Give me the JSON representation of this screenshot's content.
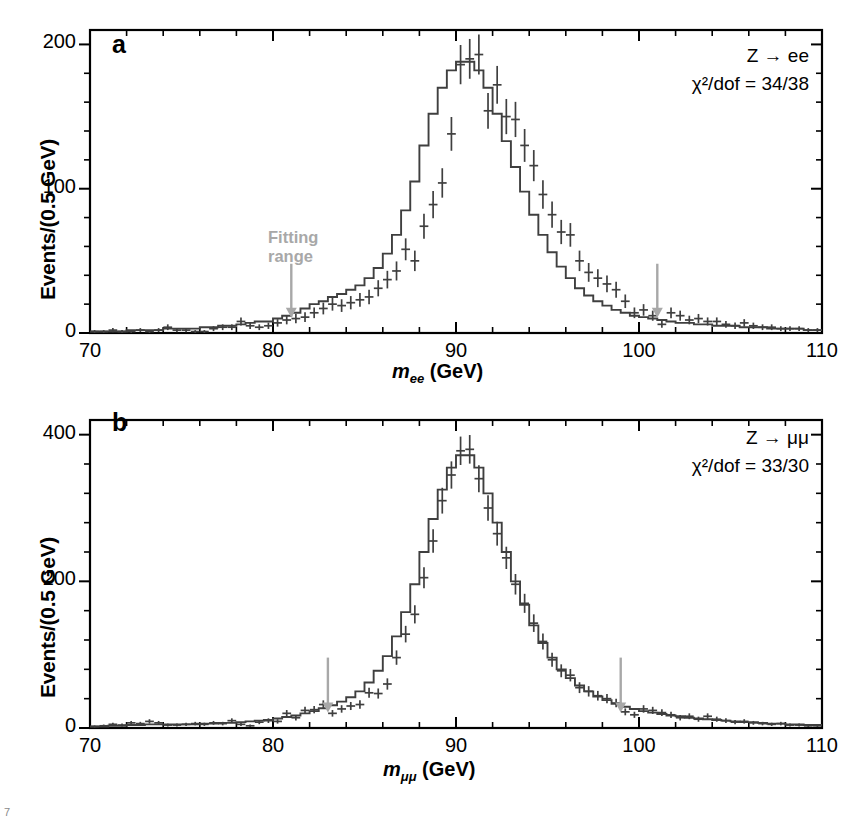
{
  "figure": {
    "width": 861,
    "height": 825,
    "background": "#ffffff",
    "ink_color": "#3f3f3f",
    "axis_color": "#000000",
    "fitting_range_color": "#a8a8a8",
    "corner_mark": "7"
  },
  "chart_data": [
    {
      "type": "line",
      "panel_letter": "a",
      "title": "",
      "xlabel": "m_ee (GeV)",
      "xlabel_parts": {
        "m": "m",
        "sub": "ee",
        "unit": "(GeV)"
      },
      "ylabel": "Events/(0.5 GeV)",
      "xlim": [
        70,
        110
      ],
      "ylim": [
        0,
        210
      ],
      "xticks": [
        70,
        80,
        90,
        100,
        110
      ],
      "xticks_labels": [
        "70",
        "80",
        "90",
        "100",
        "110"
      ],
      "yticks": [
        0,
        100,
        200
      ],
      "yticks_labels": [
        "0",
        "100",
        "200"
      ],
      "x_minor_step": 2,
      "y_minor_step": 20,
      "grid": false,
      "bin_width": 0.5,
      "annotations": [
        {
          "text": "Z → ee",
          "position": "top-right"
        },
        {
          "text": "χ²/dof = 34/38",
          "position": "top-right"
        }
      ],
      "arrows": [
        {
          "label": "Fitting range",
          "x": 81.0,
          "y_top": 48,
          "y_bottom": 12
        },
        {
          "label": "",
          "x": 101.0,
          "y_top": 48,
          "y_bottom": 12
        }
      ],
      "fitting_range_label": "Fitting\nrange",
      "fitting_range_text_line1": "Fitting",
      "fitting_range_text_line2": "range",
      "x": [
        70.25,
        70.75,
        71.25,
        71.75,
        72.25,
        72.75,
        73.25,
        73.75,
        74.25,
        74.75,
        75.25,
        75.75,
        76.25,
        76.75,
        77.25,
        77.75,
        78.25,
        78.75,
        79.25,
        79.75,
        80.25,
        80.75,
        81.25,
        81.75,
        82.25,
        82.75,
        83.25,
        83.75,
        84.25,
        84.75,
        85.25,
        85.75,
        86.25,
        86.75,
        87.25,
        87.75,
        88.25,
        88.75,
        89.25,
        89.75,
        90.25,
        90.75,
        91.25,
        91.75,
        92.25,
        92.75,
        93.25,
        93.75,
        94.25,
        94.75,
        95.25,
        95.75,
        96.25,
        96.75,
        97.25,
        97.75,
        98.25,
        98.75,
        99.25,
        99.75,
        100.25,
        100.75,
        101.25,
        101.75,
        102.25,
        102.75,
        103.25,
        103.75,
        104.25,
        104.75,
        105.25,
        105.75,
        106.25,
        106.75,
        107.25,
        107.75,
        108.25,
        108.75,
        109.25,
        109.75
      ],
      "curve_fit": [
        1,
        1,
        1,
        1,
        2,
        2,
        2,
        2,
        3,
        3,
        3,
        3,
        4,
        4,
        5,
        5,
        6,
        7,
        8,
        8,
        10,
        12,
        14,
        17,
        20,
        22,
        25,
        27,
        30,
        33,
        38,
        45,
        55,
        68,
        85,
        105,
        130,
        152,
        170,
        182,
        188,
        188,
        182,
        170,
        152,
        133,
        115,
        98,
        82,
        68,
        56,
        46,
        38,
        31,
        26,
        22,
        19,
        16,
        14,
        12,
        11,
        10,
        9,
        8,
        7,
        7,
        6,
        6,
        5,
        5,
        5,
        4,
        4,
        4,
        3,
        3,
        3,
        3,
        2,
        2
      ],
      "data_points": [
        1,
        1,
        2,
        1,
        1,
        2,
        1,
        2,
        4,
        2,
        2,
        1,
        1,
        3,
        4,
        4,
        8,
        5,
        4,
        5,
        7,
        9,
        10,
        11,
        14,
        17,
        20,
        19,
        21,
        23,
        25,
        31,
        37,
        43,
        58,
        50,
        74,
        89,
        104,
        138,
        186,
        190,
        193,
        154,
        172,
        150,
        148,
        130,
        116,
        96,
        82,
        70,
        68,
        50,
        42,
        38,
        34,
        30,
        22,
        14,
        16,
        12,
        6,
        14,
        12,
        9,
        10,
        8,
        8,
        6,
        5,
        7,
        5,
        4,
        4,
        3,
        3,
        3,
        2,
        2
      ],
      "errors": [
        1,
        1,
        1.4,
        1,
        1,
        1.4,
        1,
        1.4,
        2,
        1.4,
        1.4,
        1,
        1,
        1.7,
        2,
        2,
        2.8,
        2.2,
        2,
        2.2,
        2.6,
        3,
        3.2,
        3.3,
        3.7,
        4.1,
        4.5,
        4.4,
        4.6,
        4.8,
        5,
        5.6,
        6.1,
        6.6,
        7.6,
        7.1,
        8.6,
        9.4,
        10.2,
        11.7,
        13.6,
        13.8,
        13.9,
        12.4,
        13.1,
        12.2,
        12.2,
        11.4,
        10.8,
        9.8,
        9.1,
        8.4,
        8.2,
        7.1,
        6.5,
        6.2,
        5.8,
        5.5,
        4.7,
        3.7,
        4,
        3.5,
        2.4,
        3.7,
        3.5,
        3,
        3.2,
        2.8,
        2.8,
        2.4,
        2.2,
        2.6,
        2.2,
        2,
        2,
        1.7,
        1.7,
        1.7,
        1.4,
        1.4
      ]
    },
    {
      "type": "line",
      "panel_letter": "b",
      "title": "",
      "xlabel": "m_μμ (GeV)",
      "xlabel_parts": {
        "m": "m",
        "sub": "μμ",
        "unit": "(GeV)"
      },
      "ylabel": "Events/(0.5 GeV)",
      "xlim": [
        70,
        110
      ],
      "ylim": [
        0,
        420
      ],
      "xticks": [
        70,
        80,
        90,
        100,
        110
      ],
      "xticks_labels": [
        "70",
        "80",
        "90",
        "100",
        "110"
      ],
      "yticks": [
        0,
        200,
        400
      ],
      "yticks_labels": [
        "0",
        "200",
        "400"
      ],
      "x_minor_step": 2,
      "y_minor_step": 40,
      "grid": false,
      "bin_width": 0.5,
      "annotations": [
        {
          "text": "Z → μμ",
          "position": "top-right"
        },
        {
          "text": "χ²/dof = 33/30",
          "position": "top-right"
        }
      ],
      "arrows": [
        {
          "label": "Fitting range",
          "x": 83.0,
          "y_top": 96,
          "y_bottom": 24
        },
        {
          "label": "",
          "x": 99.0,
          "y_top": 96,
          "y_bottom": 24
        }
      ],
      "fitting_range_label": "Fitting\nrange",
      "fitting_range_text_line1": "Fitting",
      "fitting_range_text_line2": "range",
      "x": [
        70.25,
        70.75,
        71.25,
        71.75,
        72.25,
        72.75,
        73.25,
        73.75,
        74.25,
        74.75,
        75.25,
        75.75,
        76.25,
        76.75,
        77.25,
        77.75,
        78.25,
        78.75,
        79.25,
        79.75,
        80.25,
        80.75,
        81.25,
        81.75,
        82.25,
        82.75,
        83.25,
        83.75,
        84.25,
        84.75,
        85.25,
        85.75,
        86.25,
        86.75,
        87.25,
        87.75,
        88.25,
        88.75,
        89.25,
        89.75,
        90.25,
        90.75,
        91.25,
        91.75,
        92.25,
        92.75,
        93.25,
        93.75,
        94.25,
        94.75,
        95.25,
        95.75,
        96.25,
        96.75,
        97.25,
        97.75,
        98.25,
        98.75,
        99.25,
        99.75,
        100.25,
        100.75,
        101.25,
        101.75,
        102.25,
        102.75,
        103.25,
        103.75,
        104.25,
        104.75,
        105.25,
        105.75,
        106.25,
        106.75,
        107.25,
        107.75,
        108.25,
        108.75,
        109.25,
        109.75
      ],
      "curve_fit": [
        2,
        2,
        3,
        3,
        4,
        4,
        5,
        5,
        5,
        5,
        5,
        5,
        6,
        6,
        7,
        7,
        8,
        9,
        10,
        11,
        13,
        15,
        17,
        20,
        23,
        27,
        31,
        36,
        42,
        50,
        62,
        78,
        98,
        125,
        158,
        196,
        240,
        285,
        325,
        355,
        372,
        372,
        355,
        320,
        280,
        240,
        200,
        168,
        140,
        116,
        96,
        80,
        68,
        58,
        50,
        43,
        38,
        33,
        29,
        26,
        23,
        21,
        19,
        17,
        16,
        14,
        13,
        12,
        11,
        10,
        9,
        8,
        8,
        7,
        6,
        6,
        5,
        5,
        4,
        4
      ],
      "data_points": [
        2,
        3,
        5,
        4,
        7,
        6,
        9,
        7,
        4,
        4,
        5,
        6,
        5,
        7,
        6,
        10,
        5,
        3,
        8,
        10,
        9,
        20,
        14,
        24,
        25,
        32,
        20,
        26,
        30,
        32,
        48,
        47,
        60,
        96,
        128,
        155,
        205,
        255,
        310,
        345,
        378,
        380,
        340,
        300,
        265,
        232,
        196,
        170,
        143,
        118,
        93,
        78,
        72,
        55,
        50,
        44,
        40,
        34,
        22,
        18,
        26,
        24,
        21,
        18,
        14,
        16,
        12,
        16,
        12,
        10,
        8,
        9,
        7,
        6,
        5,
        6,
        4,
        4,
        3,
        3
      ],
      "errors": [
        1.4,
        1.7,
        2.2,
        2,
        2.6,
        2.4,
        3,
        2.6,
        2,
        2,
        2.2,
        2.4,
        2.2,
        2.6,
        2.4,
        3.2,
        2.2,
        1.7,
        2.8,
        3.2,
        3,
        4.5,
        3.7,
        4.9,
        5,
        5.7,
        4.5,
        5.1,
        5.5,
        5.7,
        6.9,
        6.9,
        7.7,
        9.8,
        11.3,
        12.4,
        14.3,
        16,
        17.6,
        18.6,
        19.4,
        19.5,
        18.4,
        17.3,
        16.3,
        15.2,
        14,
        13,
        12,
        10.9,
        9.6,
        8.8,
        8.5,
        7.4,
        7.1,
        6.6,
        6.3,
        5.8,
        4.7,
        4.2,
        5.1,
        4.9,
        4.6,
        4.2,
        3.7,
        4,
        3.5,
        4,
        3.5,
        3.2,
        2.8,
        3,
        2.6,
        2.4,
        2.2,
        2.4,
        2,
        2,
        1.7,
        1.7
      ]
    }
  ]
}
